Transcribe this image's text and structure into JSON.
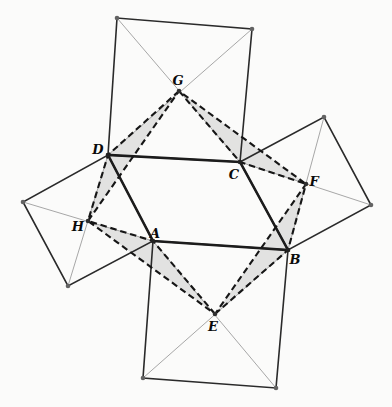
{
  "figure": {
    "width": 392,
    "height": 407,
    "background": "#fbfbfa"
  },
  "colors": {
    "parallelogram_stroke": "#1c1c1c",
    "square_stroke": "#2a2a2a",
    "diagonal_stroke": "#9d9d9d",
    "dashed_stroke": "#161616",
    "shade_fill": "#e2e2e1",
    "corner_dot": "#636363",
    "center_dot": "#303030",
    "vertex_dot": "#222222",
    "label_color": "#0a0a0a"
  },
  "stroke_widths": {
    "parallelogram": 2.6,
    "square": 1.6,
    "diagonal": 0.9,
    "dashed": 2.1
  },
  "dash_pattern": "6.5 3.8",
  "dot_radius": 2.3,
  "points": {
    "A": [
      153,
      241
    ],
    "B": [
      288,
      250
    ],
    "C": [
      240,
      162
    ],
    "D": [
      108,
      155
    ],
    "E": [
      215,
      314
    ],
    "F": [
      306,
      184
    ],
    "G": [
      179,
      91
    ],
    "H": [
      88,
      221
    ],
    "DT": [
      117,
      18
    ],
    "CT": [
      252,
      29
    ],
    "CR": [
      324,
      117
    ],
    "BR": [
      371,
      205
    ],
    "BB": [
      276,
      388
    ],
    "AB2": [
      143,
      378
    ],
    "DL": [
      23,
      202
    ],
    "AL": [
      68,
      286
    ]
  },
  "parallelogram": [
    "A",
    "B",
    "C",
    "D"
  ],
  "squares": [
    {
      "name": "square-on-DC",
      "corners": [
        "D",
        "DT",
        "CT",
        "C"
      ],
      "diagonals": [
        [
          "DT",
          "C"
        ],
        [
          "CT",
          "D"
        ]
      ],
      "center": "G"
    },
    {
      "name": "square-on-CB",
      "corners": [
        "C",
        "CR",
        "BR",
        "B"
      ],
      "diagonals": [
        [
          "C",
          "BR"
        ],
        [
          "CR",
          "B"
        ]
      ],
      "center": "F"
    },
    {
      "name": "square-on-AB",
      "corners": [
        "A",
        "B",
        "BB",
        "AB2"
      ],
      "diagonals": [
        [
          "A",
          "BB"
        ],
        [
          "B",
          "AB2"
        ]
      ],
      "center": "E"
    },
    {
      "name": "square-on-DA",
      "corners": [
        "D",
        "A",
        "AL",
        "DL"
      ],
      "diagonals": [
        [
          "DL",
          "A"
        ],
        [
          "D",
          "AL"
        ]
      ],
      "center": "H"
    }
  ],
  "shaded_triangles": [
    {
      "name": "triangle-GDH",
      "vertices": [
        "G",
        "D",
        "H"
      ]
    },
    {
      "name": "triangle-GCF",
      "vertices": [
        "G",
        "C",
        "F"
      ]
    },
    {
      "name": "triangle-EAH",
      "vertices": [
        "E",
        "A",
        "H"
      ]
    },
    {
      "name": "triangle-EBF",
      "vertices": [
        "E",
        "B",
        "F"
      ]
    }
  ],
  "dots": {
    "corners": [
      "DT",
      "CT",
      "CR",
      "BR",
      "BB",
      "AB2",
      "DL",
      "AL"
    ],
    "centers": [
      "E",
      "F",
      "G",
      "H"
    ],
    "vertices": [
      "A",
      "B",
      "C",
      "D"
    ]
  },
  "labels": [
    {
      "text": "A",
      "x": 155,
      "y": 233
    },
    {
      "text": "B",
      "x": 295,
      "y": 259
    },
    {
      "text": "C",
      "x": 234,
      "y": 174
    },
    {
      "text": "D",
      "x": 98,
      "y": 149
    },
    {
      "text": "E",
      "x": 213,
      "y": 326
    },
    {
      "text": "F",
      "x": 314,
      "y": 181
    },
    {
      "text": "G",
      "x": 178,
      "y": 80
    },
    {
      "text": "H",
      "x": 78,
      "y": 226
    }
  ]
}
